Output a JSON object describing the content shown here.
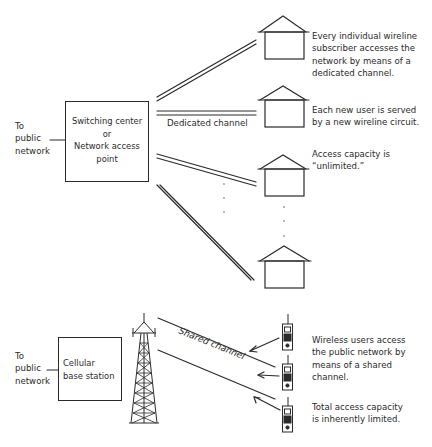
{
  "wireline": {
    "to_public_network": [
      "To",
      "public",
      "network"
    ],
    "switching_center": [
      "Switching center",
      "or",
      "Network access",
      "point"
    ],
    "dedicated_channel_label": "Dedicated channel",
    "notes": [
      [
        "Every individual wireline",
        "subscriber accesses the",
        "network by means of a",
        "dedicated channel."
      ],
      [
        "Each new user is served",
        "by a new wireline circuit."
      ],
      [
        "Access capacity is",
        "“unlimited.”"
      ]
    ],
    "house_count": 4
  },
  "wireless": {
    "to_public_network": [
      "To",
      "public",
      "network"
    ],
    "base_station": [
      "Cellular",
      "base station"
    ],
    "shared_channel_label": "Shared channel",
    "notes": [
      [
        "Wireless users access",
        "the public network by",
        "means of a shared",
        "channel."
      ],
      [
        "Total access capacity",
        "is inherently limited."
      ]
    ],
    "phone_count": 3
  },
  "colors": {
    "ink": "#2a2a2a",
    "background": "#ffffff",
    "dots": "#9a9a9a"
  }
}
